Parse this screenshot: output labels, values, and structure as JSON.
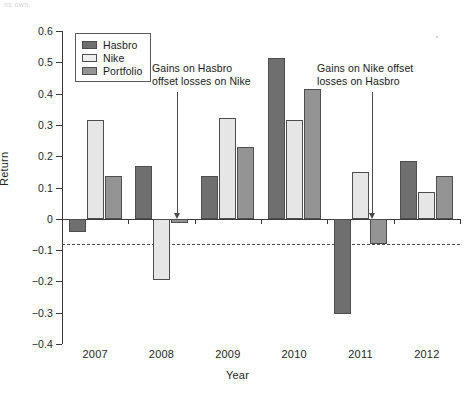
{
  "scan": {
    "bleed_text": "ns own."
  },
  "chart_data": {
    "type": "bar",
    "title": "",
    "xlabel": "Year",
    "ylabel": "Return",
    "categories": [
      "2007",
      "2008",
      "2009",
      "2010",
      "2011",
      "2012"
    ],
    "series": [
      {
        "name": "Hasbro",
        "color": "#6f6f6f",
        "values": [
          -0.042,
          0.17,
          0.136,
          0.515,
          -0.305,
          0.185
        ]
      },
      {
        "name": "Nike",
        "color": "#e6e6e6",
        "values": [
          0.316,
          -0.195,
          0.322,
          0.317,
          0.148,
          0.085
        ]
      },
      {
        "name": "Portfolio",
        "color": "#949494",
        "values": [
          0.138,
          -0.012,
          0.229,
          0.414,
          -0.081,
          0.136
        ]
      }
    ],
    "ylim": [
      -0.4,
      0.6
    ],
    "yticks": [
      0.6,
      0.5,
      0.4,
      0.3,
      0.2,
      0.1,
      0,
      -0.1,
      -0.2,
      -0.3,
      -0.4
    ],
    "ytick_labels": [
      "0.6",
      "0.5",
      "0.4",
      "0.3",
      "0.2",
      "0.1",
      "0",
      "−0.1",
      "−0.2",
      "−0.3",
      "−0.4"
    ],
    "grid": false,
    "legend_position": "top-left",
    "reference_line": {
      "value": -0.081,
      "style": "dashed",
      "label": ""
    },
    "annotations": [
      {
        "id": "gains-hasbro-offset-nike",
        "line1": "Gains on Hasbro",
        "line2": "offset losses on Nike",
        "points_to_year": "2008",
        "points_to_value": 0
      },
      {
        "id": "gains-nike-offset-hasbro",
        "line1": "Gains on Nike offset",
        "line2": "losses on Hasbro",
        "points_to_year": "2011",
        "points_to_value": 0
      }
    ]
  },
  "legend": {
    "items": [
      {
        "label": "Hasbro",
        "swatch": "hasbro"
      },
      {
        "label": "Nike",
        "swatch": "nike"
      },
      {
        "label": "Portfolio",
        "swatch": "portfolio"
      }
    ]
  }
}
